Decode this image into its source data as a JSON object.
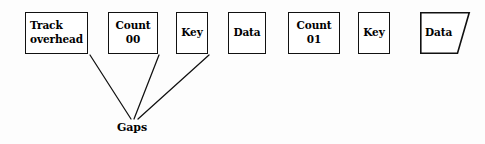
{
  "diagram": {
    "background_color": "#fdfdfd",
    "stroke_color": "#111111",
    "text_color": "#000000",
    "boxes": [
      {
        "id": "track-overhead",
        "lines": [
          "Track",
          "overhead"
        ],
        "line1": "Track",
        "line2": "overhead",
        "align": "left",
        "shape": "rect",
        "x": 25,
        "y": 12,
        "w": 63,
        "h": 42
      },
      {
        "id": "count-00",
        "lines": [
          "Count",
          "00"
        ],
        "line1": "Count",
        "line2": "00",
        "align": "center",
        "shape": "rect",
        "x": 108,
        "y": 12,
        "w": 50,
        "h": 42
      },
      {
        "id": "key-1",
        "lines": [
          "Key"
        ],
        "line1": "Key",
        "line2": "",
        "align": "center",
        "shape": "rect",
        "x": 176,
        "y": 12,
        "w": 32,
        "h": 42
      },
      {
        "id": "data-1",
        "lines": [
          "Data"
        ],
        "line1": "Data",
        "line2": "",
        "align": "center",
        "shape": "rect",
        "x": 228,
        "y": 12,
        "w": 38,
        "h": 42
      },
      {
        "id": "count-01",
        "lines": [
          "Count",
          "01"
        ],
        "line1": "Count",
        "line2": "01",
        "align": "center",
        "shape": "rect",
        "x": 288,
        "y": 12,
        "w": 52,
        "h": 42
      },
      {
        "id": "key-2",
        "lines": [
          "Key"
        ],
        "line1": "Key",
        "line2": "",
        "align": "center",
        "shape": "rect",
        "x": 358,
        "y": 12,
        "w": 32,
        "h": 42
      }
    ],
    "terminal_box": {
      "id": "data-2-continued",
      "label": "Data",
      "shape": "clipped-rect",
      "x": 420,
      "y": 12,
      "w": 50,
      "h": 42,
      "clip_inset": 12
    },
    "connectors": [
      {
        "id": "gap-line-1",
        "from": "track-overhead",
        "x1": 90,
        "y1": 55,
        "x2": 131,
        "y2": 119
      },
      {
        "id": "gap-line-2",
        "from": "count-00",
        "x1": 159,
        "y1": 55,
        "x2": 134,
        "y2": 119
      },
      {
        "id": "gap-line-3",
        "from": "key-1",
        "x1": 209,
        "y1": 55,
        "x2": 138,
        "y2": 119
      }
    ],
    "caption": {
      "id": "gaps-caption",
      "text": "Gaps",
      "x": 117,
      "y": 121
    }
  }
}
